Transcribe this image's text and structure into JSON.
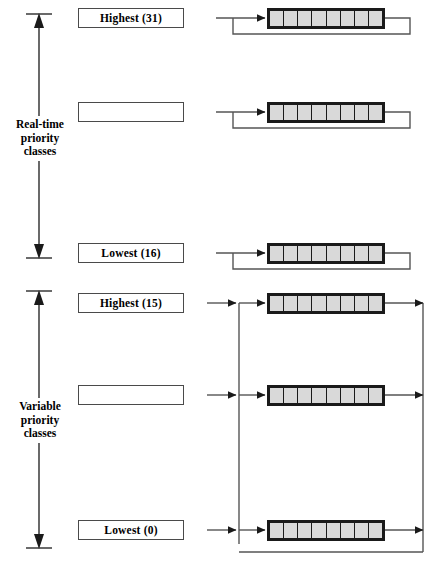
{
  "diagram": {
    "cells_per_queue": 8,
    "colors": {
      "queue_fill": "#d9d9d9",
      "queue_border": "#1a1a1a",
      "line": "#555555",
      "label_border": "#4a4a4a",
      "text": "#000000",
      "background": "#ffffff"
    },
    "groups": [
      {
        "id": "real-time",
        "label_lines": [
          "Real-time",
          "priority",
          "classes"
        ],
        "label_text": "Real-time priority classes",
        "rows": [
          {
            "id": "rt-highest",
            "label": "Highest (31)",
            "show_label": true
          },
          {
            "id": "rt-middle",
            "label": "",
            "show_label": false
          },
          {
            "id": "rt-lowest",
            "label": "Lowest (16)",
            "show_label": true
          }
        ]
      },
      {
        "id": "variable",
        "label_lines": [
          "Variable",
          "priority",
          "classes"
        ],
        "label_text": "Variable priority classes",
        "rows": [
          {
            "id": "var-highest",
            "label": "Highest (15)",
            "show_label": true
          },
          {
            "id": "var-middle",
            "label": "",
            "show_label": false
          },
          {
            "id": "var-lowest",
            "label": "Lowest (0)",
            "show_label": true
          }
        ]
      }
    ]
  }
}
